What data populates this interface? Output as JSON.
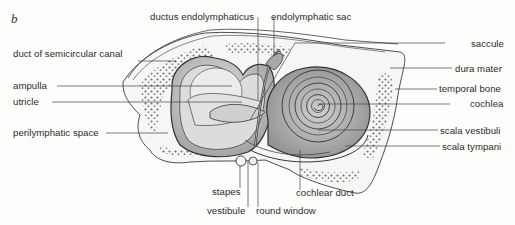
{
  "figure": {
    "panel_letter": "b",
    "colors": {
      "line": "#3a3a3a",
      "stipple_dark": "#8a8a8a",
      "stipple_light": "#cfcfcf",
      "bone_dots": "#4a4a4a",
      "background": "#fdfdfb"
    },
    "labels": {
      "ductus_endolymphaticus": "ductus endolymphaticus",
      "endolymphatic_sac": "endolymphatic sac",
      "duct_of_semicircular_canal": "duct of semicircular canal",
      "saccule": "saccule",
      "dura_mater": "dura mater",
      "ampulla": "ampulla",
      "utricle": "utricle",
      "temporal_bone": "temporal bone",
      "cochlea": "cochlea",
      "perilymphatic_space": "perilymphatic space",
      "scala_vestibuli": "scala vestibuli",
      "scala_tympani": "scala tympani",
      "stapes": "stapes",
      "vestibule": "vestibule",
      "round_window": "round window",
      "cochlear_duct": "cochlear duct"
    }
  }
}
